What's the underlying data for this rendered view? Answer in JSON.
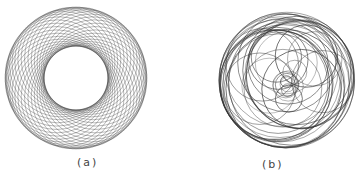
{
  "figures": [
    {
      "id": "a",
      "label": "(a)",
      "pattern": "regular-ring-of-circles",
      "center": [
        76,
        78
      ],
      "outer_radius": 71,
      "inner_radius": 32,
      "circle_count": 36
    },
    {
      "id": "b",
      "label": "(b)",
      "pattern": "irregular-overlapping-circles",
      "center": [
        287,
        80
      ],
      "outer_radius": 68
    }
  ],
  "stroke_color": "#333333"
}
